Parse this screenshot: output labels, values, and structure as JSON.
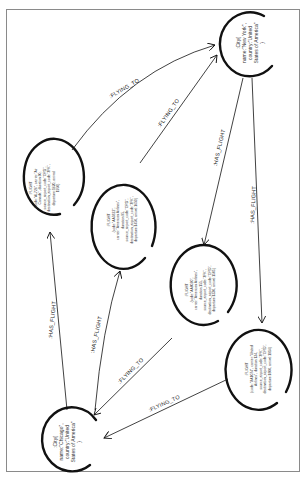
{
  "nodes": {
    "new_york": {
      "lines": [
        ":City{",
        "name:\"New York\",",
        "country:\"United",
        "States of America\"",
        "}"
      ]
    },
    "chicago": {
      "lines": [
        ":City{",
        "name:\"Chicago\",",
        "country:\"United",
        "States of America\"",
        "}"
      ]
    },
    "flight_1": {
      "lines": [
        ":FLIGHT",
        "{code:\"AL726\", carrier:\"Air",
        "Canada\", duration:90,",
        "source_airport_code:\"ORD\",",
        "destination_airport_code:\"JFK\",",
        "departure:1620, arrival:",
        "1950}"
      ]
    },
    "flight_2": {
      "lines": [
        ":FLIGHT",
        "{code:\"AA5822\",",
        "carrier:\"American Airlines\",",
        "duration:95,",
        "source_airport_code:\"ORD\",",
        "destination_airport_code:\"JFK\",",
        "departure:1450, arrival:1650}"
      ]
    },
    "flight_3": {
      "lines": [
        ":FLIGHT",
        "{code:\"AA8020\",",
        "carrier:\"American Airlines\",",
        "duration:155,",
        "source_airport_code:\"JFK\",",
        "destination_airport_code:\"ORD\",",
        "departure:1330, arrival:1505}"
      ]
    },
    "flight_4": {
      "lines": [
        ":FLIGHT",
        "{code:\"UA1074\", carrier:\"United",
        "Airlines\", duration:134,",
        "source_airport_code:\"JFK\",",
        "destination_airport_code:\"ORD\",",
        "departure:1800, arrival:1914}"
      ]
    }
  },
  "edges": {
    "flying_to_1": ":FLYING_TO",
    "flying_to_2": ":FLYING_TO",
    "flying_to_3": ":FLYING_TO",
    "flying_to_4": ":FLYING_TO",
    "has_flight_1": ":HAS_FLIGHT",
    "has_flight_2": ":HAS_FLIGHT",
    "has_flight_3": ":HAS_FLIGHT",
    "has_flight_4": ":HAS_FLIGHT"
  },
  "colors": {
    "stroke": "#111111",
    "frame": "#8a8a8a"
  }
}
